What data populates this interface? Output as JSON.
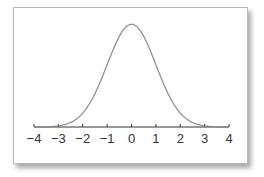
{
  "chart_data": {
    "type": "line",
    "title": "",
    "xlabel": "",
    "ylabel": "",
    "x": [
      -4,
      -3.5,
      -3,
      -2.5,
      -2,
      -1.5,
      -1,
      -0.5,
      0,
      0.5,
      1,
      1.5,
      2,
      2.5,
      3,
      3.5,
      4
    ],
    "series": [
      {
        "name": "normal pdf",
        "values": [
          0.0001,
          0.0009,
          0.0044,
          0.0175,
          0.054,
          0.1295,
          0.242,
          0.3521,
          0.3989,
          0.3521,
          0.242,
          0.1295,
          0.054,
          0.0175,
          0.0044,
          0.0009,
          0.0001
        ]
      }
    ],
    "xlim": [
      -4,
      4
    ],
    "ylim": [
      0,
      0.4
    ],
    "x_ticks": [
      "−4",
      "−3",
      "−2",
      "−1",
      "0",
      "1",
      "2",
      "3",
      "4"
    ],
    "y_axis_visible": false,
    "grid": false,
    "legend": null,
    "colors": {
      "curve": "#8a8a8a",
      "axis": "#333333",
      "frame": "#b8b8b8"
    }
  }
}
